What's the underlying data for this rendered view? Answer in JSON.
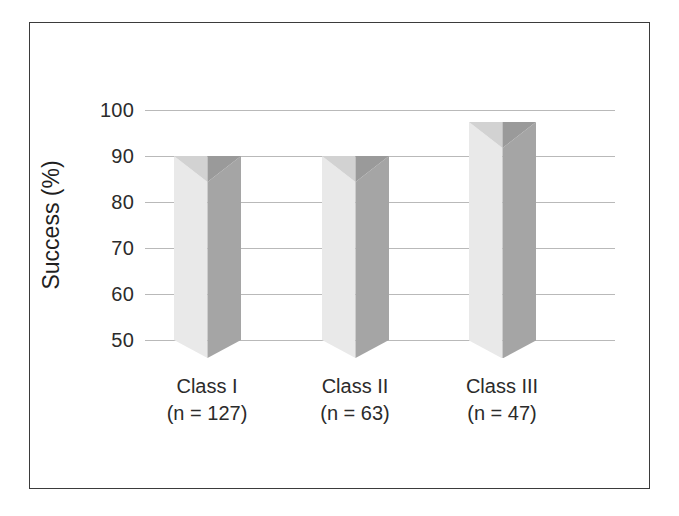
{
  "figure": {
    "background_color": "#ffffff",
    "frame_border_color": "#3b3b3b",
    "gridline_color": "#b9b9b9"
  },
  "chart_data": {
    "type": "bar",
    "title": "",
    "subtitle": "",
    "xlabel": "",
    "ylabel": "Success (%)",
    "categories": [
      "Class I",
      "Class II",
      "Class III"
    ],
    "category_sublabels": [
      "(n = 127)",
      "(n = 63)",
      "(n = 47)"
    ],
    "group_sizes": [
      127,
      63,
      47
    ],
    "values": [
      90,
      90,
      97.5
    ],
    "ylim": [
      50,
      100
    ],
    "yticks": [
      100,
      90,
      80,
      70,
      60,
      50
    ],
    "ytick_labels": [
      "100",
      "90",
      "80",
      "70",
      "60",
      "50"
    ],
    "grid": true,
    "legend": "none",
    "style": "3d-prism-bars",
    "bar_face_light_color": "#e9e9e9",
    "bar_face_dark_color": "#a5a5a5",
    "bar_top_light_color": "#d2d2d2",
    "bar_top_dark_color": "#9a9a9a"
  }
}
